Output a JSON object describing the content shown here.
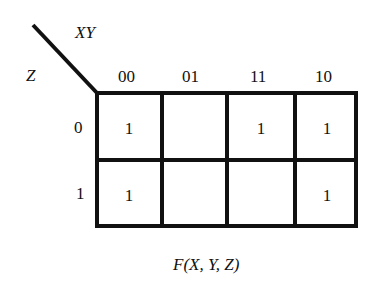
{
  "diagram": {
    "type": "karnaugh-map",
    "corner": {
      "column_var": "XY",
      "row_var": "Z"
    },
    "column_headers": [
      "00",
      "01",
      "11",
      "10"
    ],
    "row_headers": [
      "0",
      "1"
    ],
    "cells": [
      [
        "1",
        "",
        "1",
        "1"
      ],
      [
        "1",
        "",
        "",
        "1"
      ]
    ],
    "caption": "F(X, Y, Z)"
  }
}
